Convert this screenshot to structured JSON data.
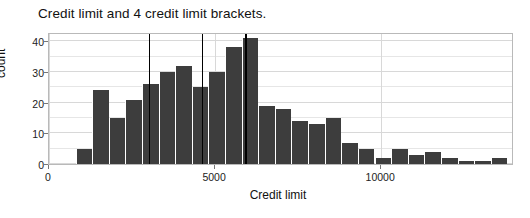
{
  "chart_data": {
    "type": "bar",
    "title": "Credit limit and 4 credit limit brackets.",
    "xlabel": "Credit limit",
    "ylabel": "count",
    "xlim": [
      0,
      14000
    ],
    "ylim": [
      0,
      43
    ],
    "grid": true,
    "legend": "none",
    "bin_width": 500,
    "bar_color": "#3d3d3d",
    "bracket_line_color": "#000000",
    "bracket_lines": [
      3000,
      4600,
      5900
    ],
    "xticks": [
      0,
      5000,
      10000
    ],
    "xtick_labels": [
      "0",
      "5000",
      "10000"
    ],
    "yticks": [
      0,
      10,
      20,
      30,
      40
    ],
    "ytick_labels": [
      "0",
      "10",
      "20",
      "30",
      "40"
    ],
    "bins": [
      {
        "x0": 800,
        "x1": 1300,
        "value": 5
      },
      {
        "x0": 1300,
        "x1": 1800,
        "value": 24
      },
      {
        "x0": 1800,
        "x1": 2300,
        "value": 15
      },
      {
        "x0": 2300,
        "x1": 2800,
        "value": 21
      },
      {
        "x0": 2800,
        "x1": 3300,
        "value": 26
      },
      {
        "x0": 3300,
        "x1": 3800,
        "value": 30
      },
      {
        "x0": 3800,
        "x1": 4300,
        "value": 32
      },
      {
        "x0": 4300,
        "x1": 4800,
        "value": 25
      },
      {
        "x0": 4800,
        "x1": 5300,
        "value": 30
      },
      {
        "x0": 5300,
        "x1": 5800,
        "value": 38
      },
      {
        "x0": 5800,
        "x1": 6300,
        "value": 41
      },
      {
        "x0": 6300,
        "x1": 6800,
        "value": 19
      },
      {
        "x0": 6800,
        "x1": 7300,
        "value": 18
      },
      {
        "x0": 7300,
        "x1": 7800,
        "value": 14
      },
      {
        "x0": 7800,
        "x1": 8300,
        "value": 13
      },
      {
        "x0": 8300,
        "x1": 8800,
        "value": 15
      },
      {
        "x0": 8800,
        "x1": 9300,
        "value": 7
      },
      {
        "x0": 9300,
        "x1": 9800,
        "value": 5
      },
      {
        "x0": 9800,
        "x1": 10300,
        "value": 2
      },
      {
        "x0": 10300,
        "x1": 10800,
        "value": 5
      },
      {
        "x0": 10800,
        "x1": 11300,
        "value": 3
      },
      {
        "x0": 11300,
        "x1": 11800,
        "value": 4
      },
      {
        "x0": 11800,
        "x1": 12300,
        "value": 2
      },
      {
        "x0": 12300,
        "x1": 12800,
        "value": 1
      },
      {
        "x0": 12800,
        "x1": 13300,
        "value": 1
      },
      {
        "x0": 13300,
        "x1": 13800,
        "value": 2
      },
      {
        "x0": 14800,
        "x1": 15300,
        "value": 1
      },
      {
        "x0": 15300,
        "x1": 15800,
        "value": 1
      }
    ]
  }
}
